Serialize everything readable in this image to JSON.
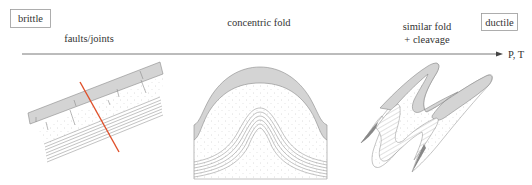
{
  "figure": {
    "left_box_label": "brittle",
    "right_box_label": "ductile",
    "axis_label": "P, T",
    "stages": [
      {
        "label": "faults/joints"
      },
      {
        "label_line1": "concentric fold"
      },
      {
        "label_line1": "similar fold",
        "label_line2": "+ cleavage"
      }
    ]
  },
  "colors": {
    "fault_line": "#e0502a",
    "layer_gray": "#d4d4d4",
    "outline": "#8a8a8a",
    "text": "#333333"
  }
}
